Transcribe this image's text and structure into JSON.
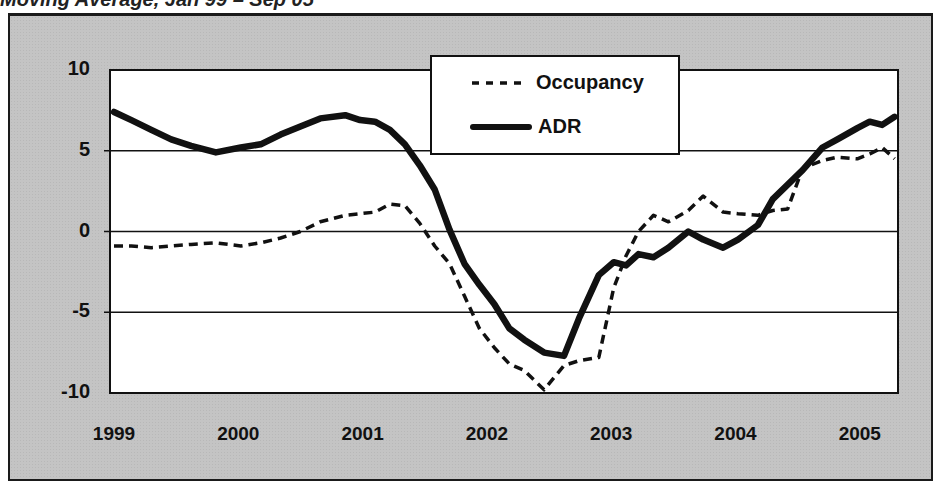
{
  "header": {
    "title_fragment": "Moving Average, Jan 99 – Sep 05"
  },
  "chart_data": {
    "type": "line",
    "title": "",
    "xlabel": "",
    "ylabel": "",
    "ylim": [
      -10,
      10
    ],
    "yticks": [
      10,
      5,
      0,
      -5,
      -10
    ],
    "ytick_labels": [
      "10",
      "5",
      "0",
      "-5",
      "-10"
    ],
    "xticks": [
      "1999",
      "2000",
      "2001",
      "2002",
      "2003",
      "2004",
      "2005"
    ],
    "grid": {
      "horizontal": true,
      "vertical": false
    },
    "legend_position": "top-center",
    "legend": [
      "Occupancy",
      "ADR"
    ],
    "x": [
      1999.0,
      1999.14,
      1999.3,
      1999.46,
      1999.62,
      1999.82,
      2000.02,
      2000.18,
      2000.34,
      2000.5,
      2000.66,
      2000.86,
      2000.98,
      2001.1,
      2001.22,
      2001.34,
      2001.46,
      2001.58,
      2001.7,
      2001.82,
      2001.94,
      2002.06,
      2002.18,
      2002.3,
      2002.46,
      2002.62,
      2002.74,
      2002.9,
      2003.02,
      2003.12,
      2003.22,
      2003.34,
      2003.46,
      2003.62,
      2003.74,
      2003.9,
      2004.02,
      2004.18,
      2004.3,
      2004.42,
      2004.54,
      2004.7,
      2004.82,
      2004.98,
      2005.08,
      2005.18,
      2005.28
    ],
    "series": [
      {
        "name": "Occupancy",
        "style": "dashed",
        "values": [
          -0.9,
          -0.9,
          -1.0,
          -0.9,
          -0.8,
          -0.7,
          -0.9,
          -0.7,
          -0.4,
          0.0,
          0.6,
          1.0,
          1.1,
          1.2,
          1.7,
          1.6,
          0.5,
          -0.9,
          -2.0,
          -4.0,
          -6.0,
          -7.2,
          -8.2,
          -8.6,
          -9.8,
          -8.3,
          -8.0,
          -7.8,
          -3.5,
          -1.5,
          0.0,
          1.0,
          0.6,
          1.3,
          2.2,
          1.2,
          1.1,
          1.0,
          1.3,
          1.4,
          3.9,
          4.4,
          4.6,
          4.5,
          4.8,
          5.2,
          4.5
        ]
      },
      {
        "name": "ADR",
        "style": "solid",
        "values": [
          7.4,
          6.9,
          6.3,
          5.7,
          5.3,
          4.9,
          5.2,
          5.4,
          6.0,
          6.5,
          7.0,
          7.2,
          6.9,
          6.8,
          6.3,
          5.4,
          4.1,
          2.6,
          0.1,
          -2.0,
          -3.3,
          -4.5,
          -6.0,
          -6.7,
          -7.5,
          -7.7,
          -5.4,
          -2.7,
          -1.9,
          -2.1,
          -1.4,
          -1.6,
          -1.0,
          0.0,
          -0.5,
          -1.0,
          -0.5,
          0.4,
          2.0,
          2.9,
          3.8,
          5.2,
          5.7,
          6.4,
          6.8,
          6.6,
          7.1
        ]
      }
    ]
  },
  "colors": {
    "frame_bg": "#c4c4c4",
    "plot_bg": "#ffffff",
    "line": "#111111",
    "grid": "#111111"
  }
}
